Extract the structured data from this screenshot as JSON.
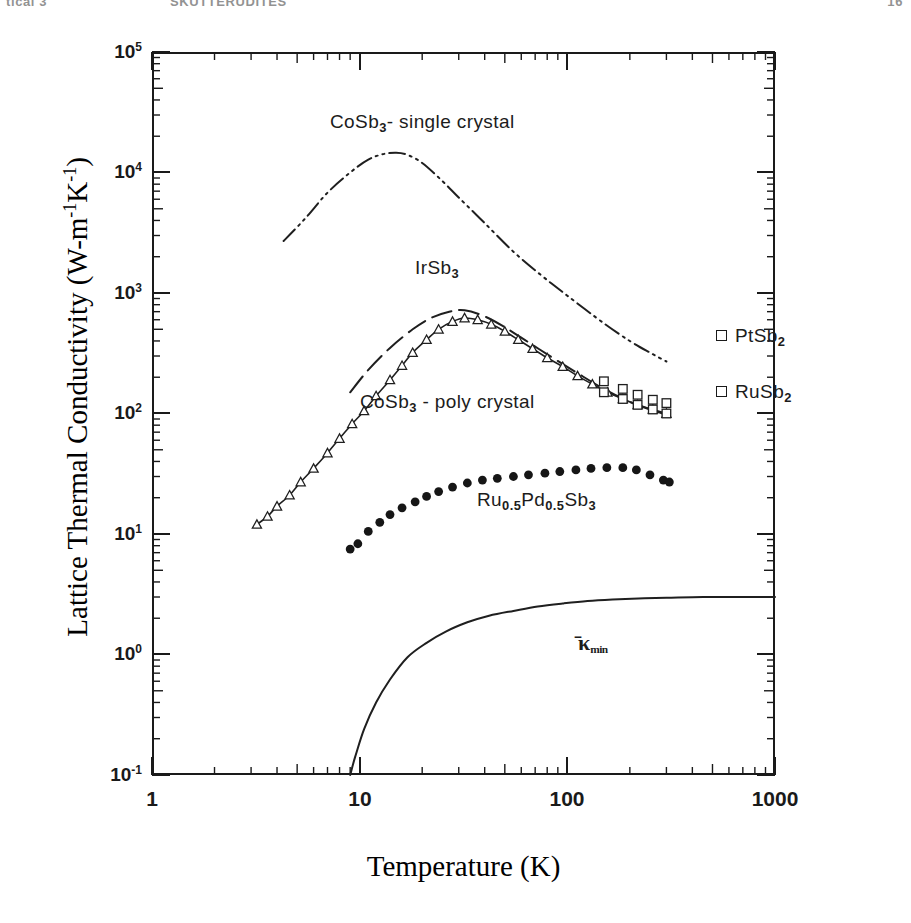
{
  "running_head": {
    "left": "tical 3",
    "middle": "SKUTTERUDITES",
    "right": "16"
  },
  "axes": {
    "y_label_prefix": "Lattice Thermal Conductivity (W-m",
    "y_label_sup1": "-1",
    "y_label_mid": "K",
    "y_label_sup2": "-1",
    "y_label_suffix": ")",
    "x_label": "Temperature (K)",
    "y_ticks": [
      {
        "mantissa": "10",
        "exp": "5"
      },
      {
        "mantissa": "10",
        "exp": "4"
      },
      {
        "mantissa": "10",
        "exp": "3"
      },
      {
        "mantissa": "10",
        "exp": "2"
      },
      {
        "mantissa": "10",
        "exp": "1"
      },
      {
        "mantissa": "10",
        "exp": "0"
      },
      {
        "mantissa": "10",
        "exp": "-1"
      }
    ],
    "x_ticks": [
      "1",
      "10",
      "100",
      "1000"
    ]
  },
  "annotations": {
    "single_crystal": "CoSb3- single crystal",
    "irsb3": "IrSb3",
    "poly_crystal": "CoSb3 - poly crystal",
    "rupdsb": "Ru0.5Pd0.5Sb3",
    "ptsb2": "PtSb2",
    "rusb2": "RuSb2",
    "kappa_min": "min"
  },
  "chart_data": {
    "type": "line",
    "title": "",
    "xlabel": "Temperature (K)",
    "ylabel": "Lattice Thermal Conductivity (W-m-1K-1)",
    "xscale": "log",
    "yscale": "log",
    "xlim": [
      1,
      1000
    ],
    "ylim": [
      0.1,
      100000
    ],
    "grid": false,
    "legend": "in-plot annotations",
    "x_tick_values": [
      1,
      10,
      100,
      1000
    ],
    "y_tick_values": [
      0.1,
      1,
      10,
      100,
      1000,
      10000,
      100000
    ],
    "series": [
      {
        "name": "CoSb3 - single crystal",
        "style": "dash-dot line",
        "marker": "none",
        "x": [
          4.3,
          5.5,
          7,
          9,
          11,
          13,
          15,
          17,
          20,
          25,
          30,
          40,
          55,
          75,
          100,
          150,
          200,
          250,
          300
        ],
        "y": [
          2700,
          4200,
          6800,
          10000,
          12800,
          14200,
          14600,
          14000,
          12000,
          8500,
          6200,
          3800,
          2200,
          1400,
          950,
          560,
          400,
          320,
          270
        ]
      },
      {
        "name": "IrSb3",
        "style": "dashed line",
        "marker": "none",
        "x": [
          9,
          11,
          14,
          18,
          22,
          27,
          32,
          40,
          50,
          65,
          85,
          110,
          150,
          200,
          250,
          300
        ],
        "y": [
          150,
          230,
          350,
          500,
          620,
          700,
          720,
          640,
          520,
          390,
          290,
          220,
          160,
          125,
          108,
          98
        ]
      },
      {
        "name": "CoSb3 - poly crystal",
        "style": "line with open triangles",
        "marker": "open-triangle",
        "x": [
          3.2,
          3.6,
          4.0,
          4.6,
          5.2,
          6.0,
          7.0,
          8.0,
          9.2,
          10.5,
          12,
          14,
          16,
          18,
          21,
          24,
          28,
          32,
          37,
          43,
          50,
          58,
          68,
          80,
          95,
          112,
          132,
          156,
          185,
          218,
          258,
          300
        ],
        "y": [
          12,
          14,
          17,
          21,
          27,
          35,
          47,
          62,
          82,
          105,
          140,
          190,
          250,
          320,
          410,
          500,
          580,
          620,
          600,
          550,
          480,
          410,
          345,
          290,
          245,
          205,
          175,
          150,
          132,
          118,
          108,
          100
        ]
      },
      {
        "name": "PtSb2",
        "style": "open squares",
        "marker": "open-square",
        "x": [
          150,
          185,
          218,
          258,
          300
        ],
        "y": [
          185,
          160,
          143,
          130,
          122
        ]
      },
      {
        "name": "RuSb2",
        "style": "open squares",
        "marker": "open-square",
        "x": [
          150,
          185,
          218,
          258,
          300
        ],
        "y": [
          150,
          132,
          118,
          108,
          100
        ]
      },
      {
        "name": "Ru0.5Pd0.5Sb3",
        "style": "filled circles",
        "marker": "filled-circle",
        "x": [
          9.0,
          9.8,
          11,
          12.5,
          14,
          16,
          18.5,
          21,
          24,
          28,
          33,
          39,
          46,
          55,
          65,
          78,
          92,
          110,
          130,
          155,
          185,
          215,
          250,
          290,
          310
        ],
        "y": [
          7.5,
          8.3,
          10.5,
          12.5,
          14.5,
          16.5,
          18.5,
          20.5,
          22.5,
          24.5,
          26.5,
          28,
          29,
          30,
          31,
          32,
          33,
          34,
          35,
          35.5,
          35.5,
          34,
          31,
          28,
          27
        ]
      },
      {
        "name": "kappa_min",
        "style": "solid line",
        "marker": "none",
        "x": [
          9.0,
          9.5,
          10.5,
          12,
          14,
          17,
          21,
          26,
          33,
          42,
          55,
          72,
          95,
          125,
          165,
          220,
          300,
          450,
          700,
          1000
        ],
        "y": [
          0.1,
          0.14,
          0.24,
          0.4,
          0.62,
          0.95,
          1.25,
          1.55,
          1.85,
          2.1,
          2.3,
          2.5,
          2.65,
          2.78,
          2.86,
          2.92,
          2.96,
          3.0,
          3.0,
          3.0
        ]
      }
    ]
  }
}
